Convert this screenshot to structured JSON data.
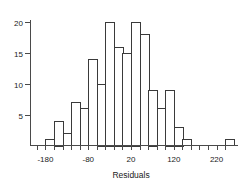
{
  "chart_data": {
    "type": "bar",
    "title": "",
    "subtitle": "",
    "xlabel": "Residuals",
    "ylabel": "",
    "grid": false,
    "legend": false,
    "legend_position": "none",
    "bin_width": 20,
    "bin_edges": [
      -200,
      -180,
      -160,
      -140,
      -120,
      -100,
      -80,
      -60,
      -40,
      -20,
      0,
      20,
      40,
      60,
      80,
      100,
      120,
      140,
      160,
      180,
      200,
      220,
      240,
      260
    ],
    "categories": [
      "-200 to -180",
      "-180 to -160",
      "-160 to -140",
      "-140 to -120",
      "-120 to -100",
      "-100 to -80",
      "-80 to -60",
      "-60 to -40",
      "-40 to -20",
      "-20 to 0",
      "0 to 20",
      "20 to 40",
      "40 to 60",
      "60 to 80",
      "80 to 100",
      "100 to 120",
      "120 to 140",
      "140 to 160",
      "160 to 180",
      "180 to 200",
      "200 to 220",
      "220 to 240",
      "240 to 260"
    ],
    "values": [
      0,
      1,
      4,
      2,
      7,
      6,
      14,
      10,
      20,
      16,
      15,
      20,
      18,
      9,
      6,
      9,
      3,
      1,
      0,
      0,
      0,
      0,
      1
    ],
    "xlim": [
      -215,
      270
    ],
    "ylim": [
      0,
      21
    ],
    "x_ticks_labeled": [
      -180,
      -80,
      20,
      120,
      220
    ],
    "x_tick_labels": [
      "-180",
      "-80",
      "20",
      "120",
      "220"
    ],
    "x_minor_tick_step": 20,
    "y_ticks": [
      5,
      10,
      15,
      20
    ],
    "y_tick_labels": [
      "5",
      "10",
      "15",
      "20"
    ],
    "colors": {
      "bar_fill": "#ffffff",
      "bar_stroke": "#3a3a3a",
      "axis": "#4a4a4a",
      "text": "#1a1a1a",
      "background": "#ffffff"
    }
  }
}
